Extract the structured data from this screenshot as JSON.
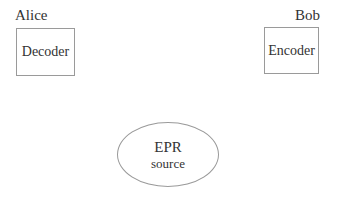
{
  "diagram": {
    "parties": [
      {
        "name": "Alice",
        "component": "Decoder"
      },
      {
        "name": "Bob",
        "component": "Encoder"
      }
    ],
    "source": {
      "line1": "EPR",
      "line2": "source"
    },
    "colors": {
      "stroke": "#9a9a9a",
      "text": "#333333",
      "background": "#ffffff"
    }
  }
}
